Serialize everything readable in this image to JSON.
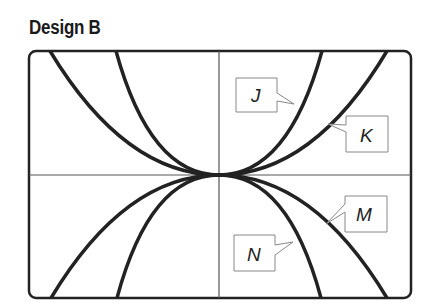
{
  "title": "Design B",
  "diagram": {
    "type": "graph-of-curves",
    "curves": [
      {
        "label": "J",
        "shape": "narrow upward parabola"
      },
      {
        "label": "K",
        "shape": "wide upward parabola"
      },
      {
        "label": "M",
        "shape": "wide downward parabola"
      },
      {
        "label": "N",
        "shape": "narrow downward parabola"
      }
    ],
    "axes": {
      "x_axis": true,
      "y_axis": true
    },
    "colors": {
      "stroke": "#222222",
      "axis": "#555555",
      "label_box": "#888888"
    }
  }
}
